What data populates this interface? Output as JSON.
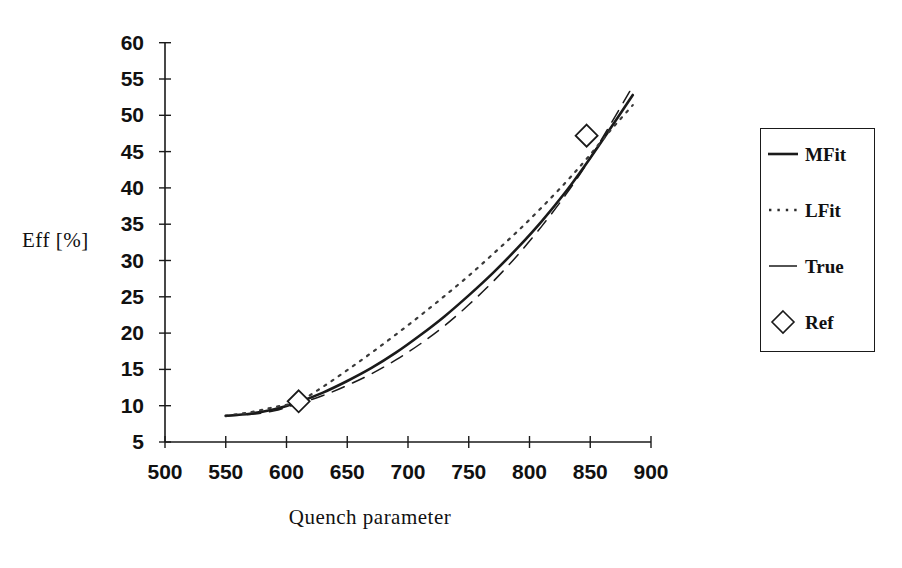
{
  "chart_data": {
    "type": "line",
    "title": "",
    "xlabel": "Quench parameter",
    "ylabel": "Eff [%]",
    "xlim": [
      500,
      900
    ],
    "ylim": [
      5,
      60
    ],
    "xticks": [
      500,
      550,
      600,
      650,
      700,
      750,
      800,
      850,
      900
    ],
    "yticks": [
      5,
      10,
      15,
      20,
      25,
      30,
      35,
      40,
      45,
      50,
      55,
      60
    ],
    "grid": false,
    "legend_position": "right-outside",
    "legend": [
      "MFit",
      "LFit",
      "True",
      "Ref"
    ],
    "series": [
      {
        "name": "MFit",
        "style": "solid",
        "x": [
          550,
          570,
          590,
          610,
          630,
          650,
          670,
          690,
          710,
          730,
          750,
          770,
          790,
          810,
          830,
          847,
          865,
          885
        ],
        "y": [
          8.6,
          8.9,
          9.5,
          10.5,
          11.8,
          13.4,
          15.2,
          17.3,
          19.7,
          22.3,
          25.2,
          28.3,
          31.7,
          35.4,
          39.5,
          43.4,
          47.8,
          52.8
        ]
      },
      {
        "name": "LFit",
        "style": "dotted",
        "x": [
          550,
          570,
          590,
          610,
          630,
          650,
          670,
          690,
          710,
          730,
          750,
          770,
          790,
          810,
          830,
          847,
          865,
          885
        ],
        "y": [
          8.6,
          9.1,
          9.8,
          10.6,
          12.6,
          14.9,
          17.3,
          19.8,
          22.4,
          25.1,
          27.9,
          30.9,
          34.0,
          37.3,
          40.8,
          44.0,
          47.6,
          51.4
        ]
      },
      {
        "name": "True",
        "style": "dashed",
        "x": [
          550,
          570,
          590,
          610,
          630,
          650,
          670,
          690,
          710,
          730,
          750,
          770,
          790,
          810,
          830,
          847,
          865,
          885
        ],
        "y": [
          8.6,
          8.8,
          9.3,
          10.3,
          11.4,
          12.8,
          14.4,
          16.3,
          18.5,
          21.0,
          23.9,
          27.1,
          30.7,
          34.7,
          39.1,
          43.3,
          48.3,
          54.0
        ]
      }
    ],
    "markers": {
      "name": "Ref",
      "symbol": "diamond",
      "points": [
        {
          "x": 610,
          "y": 10.6
        },
        {
          "x": 847,
          "y": 47.2
        }
      ]
    },
    "colors": {
      "axis": "#1a1a1a",
      "mfit": "#1a1a1a",
      "lfit": "#3a3a3a",
      "true": "#1a1a1a",
      "marker_fill": "#ffffff",
      "marker_stroke": "#1a1a1a",
      "background": "#ffffff"
    }
  },
  "legend": {
    "entries": [
      {
        "label": "MFit",
        "symbol": "line-solid-icon"
      },
      {
        "label": "LFit",
        "symbol": "line-dotted-icon"
      },
      {
        "label": "True",
        "symbol": "line-dashed-icon"
      },
      {
        "label": "Ref",
        "symbol": "diamond-marker-icon"
      }
    ]
  }
}
